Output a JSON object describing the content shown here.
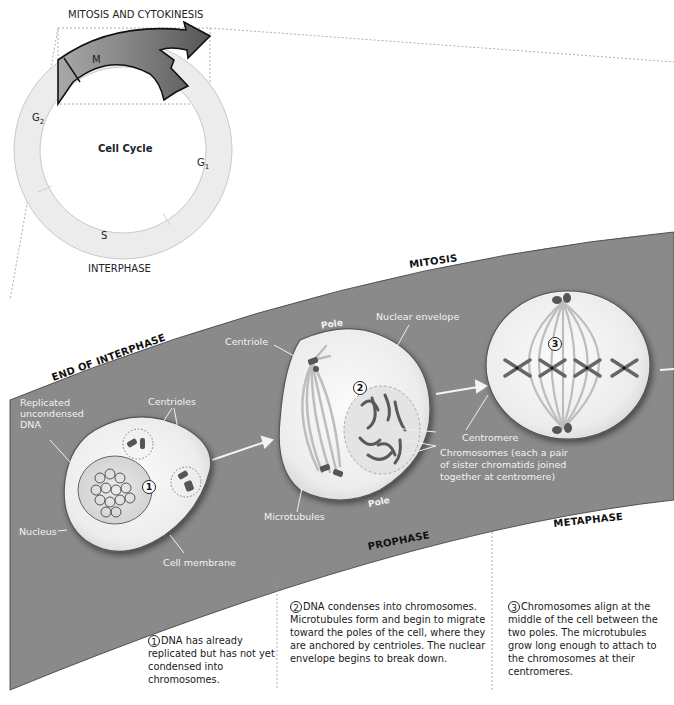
{
  "cycle": {
    "top_label": "MITOSIS AND CYTOKINESIS",
    "bottom_label": "INTERPHASE",
    "center_label": "Cell Cycle",
    "segments": {
      "m": "M",
      "g2": "G",
      "g2_sub": "2",
      "g1": "G",
      "g1_sub": "1",
      "s": "S"
    }
  },
  "band": {
    "color": "#8c8c8c",
    "phases": {
      "end_of_interphase": "END OF INTERPHASE",
      "mitosis": "MITOSIS",
      "prophase": "PROPHASE",
      "metaphase": "METAPHASE"
    }
  },
  "labels": {
    "replicated": [
      "Replicated",
      "uncondensed",
      "DNA"
    ],
    "centrioles": "Centrioles",
    "nucleus": "Nucleus",
    "cell_membrane": "Cell membrane",
    "centriole": "Centriole",
    "pole_top": "Pole",
    "pole_bottom": "Pole",
    "nuclear_envelope": "Nuclear envelope",
    "microtubules": "Microtubules",
    "centromere": "Centromere",
    "chromosomes": [
      "Chromosomes (each a pair",
      "of sister chromatids joined",
      "together at centromere)"
    ]
  },
  "steps": [
    {
      "number": "1",
      "text": "DNA has already replicated but has not yet condensed into chromosomes."
    },
    {
      "number": "2",
      "text": "DNA condenses into chromosomes. Microtubules form and begin to migrate toward the poles of the cell, where they are anchored by centrioles. The nuclear envelope begins to break down."
    },
    {
      "number": "3",
      "text": "Chromosomes align at the middle of the cell between the two poles. The microtubules grow long enough to attach to the chromosomes at their centromeres."
    }
  ]
}
